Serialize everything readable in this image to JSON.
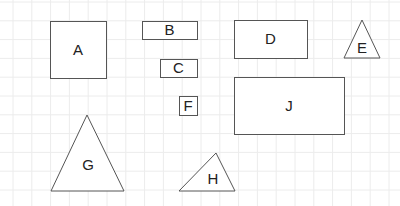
{
  "grid": {
    "spacing": 18.8,
    "offset_x": 13,
    "offset_y": 2,
    "color": "#ececec"
  },
  "stroke_color": "#555555",
  "shapes": [
    {
      "id": "A",
      "type": "rect",
      "x": 50,
      "y": 21,
      "w": 56,
      "h": 57,
      "label": "A"
    },
    {
      "id": "B",
      "type": "rect",
      "x": 142,
      "y": 21,
      "w": 55,
      "h": 18,
      "label": "B"
    },
    {
      "id": "C",
      "type": "rect",
      "x": 160,
      "y": 59,
      "w": 37,
      "h": 18,
      "label": "C"
    },
    {
      "id": "D",
      "type": "rect",
      "x": 234,
      "y": 20,
      "w": 73,
      "h": 38,
      "label": "D"
    },
    {
      "id": "E",
      "type": "triangle",
      "points": [
        [
          362,
          20
        ],
        [
          380,
          58
        ],
        [
          344,
          58
        ]
      ],
      "label": "E",
      "lx": 362,
      "ly": 53
    },
    {
      "id": "F",
      "type": "rect",
      "x": 179,
      "y": 96,
      "w": 18,
      "h": 19,
      "label": "F"
    },
    {
      "id": "J",
      "type": "rect",
      "x": 234,
      "y": 77,
      "w": 110,
      "h": 57,
      "label": "J"
    },
    {
      "id": "G",
      "type": "triangle",
      "points": [
        [
          87,
          115
        ],
        [
          124,
          191
        ],
        [
          51,
          191
        ]
      ],
      "label": "G",
      "lx": 88,
      "ly": 170
    },
    {
      "id": "H",
      "type": "triangle",
      "points": [
        [
          216,
          153
        ],
        [
          235,
          191
        ],
        [
          179,
          191
        ]
      ],
      "label": "H",
      "lx": 213,
      "ly": 184
    }
  ]
}
